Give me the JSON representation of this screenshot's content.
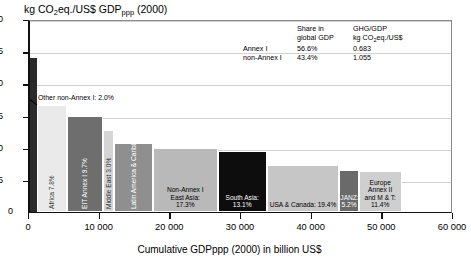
{
  "chart_data": {
    "type": "bar",
    "title": "kg CO2eq./US$ GDPppp (2000)",
    "title_main": "kg CO",
    "title_sub1": "2",
    "title_mid": "eq./US$ GDP",
    "title_sub2": "ppp",
    "title_end": " (2000)",
    "xlabel": "Cumulative GDPppp (2000) in billion US$",
    "ylabel": "kg CO2eq./US$ GDPppp (2000)",
    "xlim": [
      0,
      60000
    ],
    "ylim": [
      0,
      3.0
    ],
    "grid": true,
    "note": "Marimekko / variable-width bar chart: bar width = share of global GDP (cumulative GDPppp), bar height = GHG intensity (kg CO2eq. per US$ GDPppp)",
    "xticks": [
      "0",
      "10 000",
      "20 000",
      "30 000",
      "40 000",
      "50 000",
      "60 000"
    ],
    "xtick_values": [
      0,
      10000,
      20000,
      30000,
      40000,
      50000,
      60000
    ],
    "yticks": [
      "0",
      "0.5",
      "1.0",
      "1.5",
      "2.0",
      "2.5",
      "3.0"
    ],
    "ytick_values": [
      0,
      0.5,
      1.0,
      1.5,
      2.0,
      2.5,
      3.0
    ],
    "bars": [
      {
        "name": "Other non-Annex I",
        "label": "Other non-Annex I",
        "percent": "2.0%",
        "label_full": "Other non-Annex I: 2.0%",
        "share_pct": 2.0,
        "intensity": 2.4,
        "color": "#2b2b2b",
        "label_mode": "callout",
        "label_color": "#000000"
      },
      {
        "name": "Africa",
        "label": "Africa",
        "percent": "7.8%",
        "label_full": "Africa: 7.8%",
        "share_pct": 7.8,
        "intensity": 1.67,
        "color": "#eaeaea",
        "label_mode": "rotated",
        "label_color": "#3a3a3a"
      },
      {
        "name": "EIT Annex I",
        "label": "EIT Annex I",
        "percent": "9.7%",
        "label_full": "EIT Annex I: 9.7%",
        "share_pct": 9.7,
        "intensity": 1.5,
        "color": "#6e6e6e",
        "label_mode": "rotated",
        "label_color": "#ffffff"
      },
      {
        "name": "Middle East",
        "label": "Middle East",
        "percent": "3.0%",
        "label_full": "Middle East: 3.0%",
        "share_pct": 3.0,
        "intensity": 1.28,
        "color": "#d5d5d5",
        "label_mode": "rotated",
        "label_color": "#333333"
      },
      {
        "name": "Latin America & Caribbean",
        "label": "Latin America\n& Caribbean:",
        "percent": "10.3%",
        "label_full": "Latin America & Caribbean: 10.3%",
        "share_pct": 10.3,
        "intensity": 1.07,
        "color": "#8f8f8f",
        "label_mode": "rotated",
        "label_color": "#ffffff"
      },
      {
        "name": "Non-Annex I East Asia",
        "label": "Non-Annex I\nEast Asia:",
        "percent": "17.3%",
        "label_full": "Non-Annex I East Asia: 17.3%",
        "share_pct": 17.3,
        "intensity": 1.0,
        "color": "#b9b9b9",
        "label_mode": "inside",
        "label_color": "#000000"
      },
      {
        "name": "South Asia",
        "label": "South Asia:",
        "percent": "13.1%",
        "label_full": "South Asia: 13.1%",
        "share_pct": 13.1,
        "intensity": 0.95,
        "color": "#0d0d0d",
        "label_mode": "inside",
        "label_color": "#ffffff"
      },
      {
        "name": "USA & Canada",
        "label": "USA & Canada:",
        "percent": "19.4%",
        "label_full": "USA & Canada: 19.4%",
        "share_pct": 19.4,
        "intensity": 0.73,
        "color": "#c6c6c6",
        "label_mode": "inline",
        "label_color": "#000000"
      },
      {
        "name": "JANZ",
        "label": "JANZ:",
        "percent": "5.2%",
        "label_full": "JANZ: 5.2%",
        "share_pct": 5.2,
        "intensity": 0.66,
        "color": "#6a6a6a",
        "label_mode": "inside",
        "label_color": "#ffffff"
      },
      {
        "name": "Europe Annex II and M & T",
        "label": "Europe Annex II\nand M & T:",
        "percent": "11.4%",
        "label_full": "Europe Annex II and M & T: 11.4%",
        "share_pct": 11.4,
        "intensity": 0.63,
        "color": "#cfcfcf",
        "label_mode": "inside",
        "label_color": "#000000"
      }
    ],
    "legend": {
      "col_header_1": "",
      "col_header_2_line1": "Share in",
      "col_header_2_line2": "global GDP",
      "col_header_3_line1": "GHG/GDP",
      "col_header_3_line2_a": "kg CO",
      "col_header_3_line2_sub": "2",
      "col_header_3_line2_b": "eq./US$",
      "rows": [
        {
          "name": "Annex I",
          "share": "56.6%",
          "intensity": "0.683"
        },
        {
          "name": "non-Annex I",
          "share": "43.4%",
          "intensity": "1.055"
        }
      ]
    }
  }
}
